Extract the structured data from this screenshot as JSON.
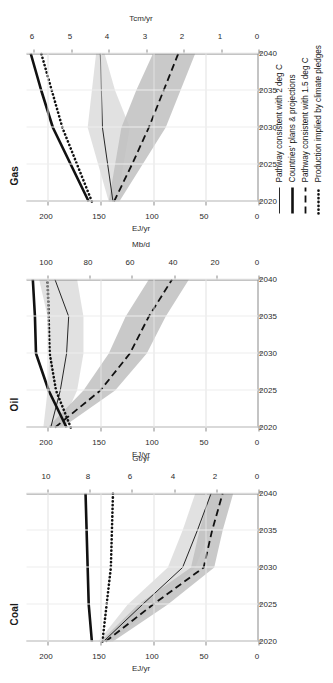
{
  "figure": {
    "panels": [
      "Coal",
      "Oil",
      "Gas"
    ]
  },
  "legend": {
    "items": [
      {
        "label": "Pathway consistent with 2 deg C",
        "style": "thin-solid",
        "color": "#111111"
      },
      {
        "label": "Countries' plans & projections",
        "style": "thick-solid",
        "color": "#111111"
      },
      {
        "label": "Pathway consistent with 1.5 deg C",
        "style": "dashed",
        "color": "#111111"
      },
      {
        "label": "Production implied by climate pledges",
        "style": "dotted",
        "color": "#111111"
      }
    ]
  },
  "colors": {
    "line": "#111111",
    "band_15c": "#bfbfbf",
    "band_2c": "#dcdcdc",
    "axis": "#8a8a8a",
    "grid": "#e2e2e2",
    "background": "#ffffff"
  },
  "chart_data": [
    {
      "type": "line",
      "title": "Coal",
      "xlabel": "",
      "ylabel": "EJ/yr",
      "y2label": "Gt/yr",
      "x": [
        2020,
        2025,
        2030,
        2035,
        2040
      ],
      "xlim": [
        2020,
        2040
      ],
      "xticks": [
        2020,
        2025,
        2030,
        2035,
        2040
      ],
      "ylim": [
        0,
        220
      ],
      "yticks": [
        0,
        50,
        100,
        150,
        200
      ],
      "y2lim": [
        0,
        11
      ],
      "y2ticks": [
        0,
        2,
        4,
        6,
        8,
        10
      ],
      "grid": true,
      "legend_position": "below-right",
      "series": [
        {
          "name": "Countries' plans & projections",
          "style": "thick-solid",
          "values": [
            158,
            161,
            162,
            163,
            164
          ]
        },
        {
          "name": "Production implied by climate pledges",
          "style": "dotted",
          "values": [
            148,
            144,
            140,
            139,
            138
          ]
        },
        {
          "name": "Pathway consistent with 2 deg C",
          "style": "thin-solid",
          "values": [
            147,
            110,
            72,
            58,
            45
          ]
        },
        {
          "name": "Pathway consistent with 1.5 deg C",
          "style": "dashed",
          "values": [
            145,
            100,
            52,
            44,
            34
          ]
        }
      ],
      "bands": [
        {
          "name": "2 deg C range",
          "lower": [
            140,
            96,
            60,
            46,
            32
          ],
          "upper": [
            152,
            124,
            86,
            72,
            60
          ]
        },
        {
          "name": "1.5 deg C range",
          "lower": [
            138,
            86,
            42,
            34,
            24
          ],
          "upper": [
            150,
            114,
            64,
            56,
            46
          ]
        }
      ]
    },
    {
      "type": "line",
      "title": "Oil",
      "xlabel": "",
      "ylabel": "EJ/yr",
      "y2label": "Mb/d",
      "x": [
        2020,
        2025,
        2030,
        2035,
        2040
      ],
      "xlim": [
        2020,
        2040
      ],
      "xticks": [
        2020,
        2025,
        2030,
        2035,
        2040
      ],
      "ylim": [
        0,
        220
      ],
      "yticks": [
        0,
        50,
        100,
        150,
        200
      ],
      "y2lim": [
        0,
        110
      ],
      "y2ticks": [
        0,
        20,
        40,
        60,
        80,
        100
      ],
      "grid": true,
      "legend_position": "below-right",
      "series": [
        {
          "name": "Countries' plans & projections",
          "style": "thick-solid",
          "values": [
            182,
            199,
            211,
            212,
            214
          ]
        },
        {
          "name": "Production implied by climate pledges",
          "style": "dotted",
          "values": [
            178,
            192,
            198,
            199,
            200
          ]
        },
        {
          "name": "Pathway consistent with 2 deg C",
          "style": "thin-solid",
          "values": [
            197,
            188,
            182,
            180,
            193
          ]
        },
        {
          "name": "Pathway consistent with 1.5 deg C",
          "style": "dashed",
          "values": [
            193,
            150,
            122,
            104,
            82
          ]
        }
      ],
      "bands": [
        {
          "name": "2 deg C range",
          "lower": [
            188,
            172,
            166,
            166,
            172
          ],
          "upper": [
            204,
            200,
            198,
            200,
            208
          ]
        },
        {
          "name": "1.5 deg C range",
          "lower": [
            186,
            136,
            106,
            88,
            66
          ],
          "upper": [
            200,
            166,
            142,
            126,
            104
          ]
        }
      ]
    },
    {
      "type": "line",
      "title": "Gas",
      "xlabel": "",
      "ylabel": "EJ/yr",
      "y2label": "Tcm/yr",
      "x": [
        2020,
        2025,
        2030,
        2035,
        2040
      ],
      "xlim": [
        2020,
        2040
      ],
      "xticks": [
        2020,
        2025,
        2030,
        2035,
        2040
      ],
      "ylim": [
        0,
        220
      ],
      "yticks": [
        0,
        50,
        100,
        150,
        200
      ],
      "y2lim": [
        0,
        6.2
      ],
      "y2ticks": [
        0,
        1,
        2,
        3,
        4,
        5,
        6
      ],
      "grid": true,
      "legend_position": "below-right",
      "series": [
        {
          "name": "Countries' plans & projections",
          "style": "thick-solid",
          "values": [
            161,
            178,
            195,
            206,
            216
          ]
        },
        {
          "name": "Production implied by climate pledges",
          "style": "dotted",
          "values": [
            158,
            172,
            186,
            196,
            206
          ]
        },
        {
          "name": "Pathway consistent with 2 deg C",
          "style": "thin-solid",
          "values": [
            138,
            143,
            148,
            149,
            150
          ]
        },
        {
          "name": "Pathway consistent with 1.5 deg C",
          "style": "dashed",
          "values": [
            137,
            120,
            104,
            90,
            76
          ]
        }
      ],
      "bands": [
        {
          "name": "2 deg C range",
          "lower": [
            134,
            128,
            122,
            136,
            146
          ],
          "upper": [
            142,
            152,
            162,
            158,
            154
          ]
        },
        {
          "name": "1.5 deg C range",
          "lower": [
            132,
            110,
            88,
            74,
            60
          ],
          "upper": [
            142,
            136,
            130,
            116,
            100
          ]
        }
      ]
    }
  ]
}
